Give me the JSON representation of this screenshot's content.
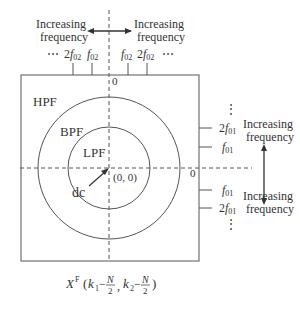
{
  "diagram": {
    "regions": {
      "hpf": "HPF",
      "bpf": "BPF",
      "lpf": "LPF",
      "dc": "dc",
      "origin": "(0, 0)"
    },
    "top_axis": {
      "zero_label": "0",
      "left_caption": [
        "Increasing",
        "frequency"
      ],
      "right_caption": [
        "Increasing",
        "frequency"
      ],
      "left_ellipsis": "⋯",
      "right_ellipsis": "⋯",
      "ticks": [
        {
          "coef": "2",
          "base": "f",
          "sub": "02"
        },
        {
          "coef": "",
          "base": "f",
          "sub": "02"
        },
        {
          "coef": "",
          "base": "f",
          "sub": "02"
        },
        {
          "coef": "2",
          "base": "f",
          "sub": "02"
        }
      ]
    },
    "right_axis": {
      "zero_label": "0",
      "top_caption": [
        "Increasing",
        "frequency"
      ],
      "bottom_caption": [
        "Increasing",
        "frequency"
      ],
      "ellipsis": "⋮",
      "ticks": [
        {
          "coef": "2",
          "base": "f",
          "sub": "01"
        },
        {
          "coef": "",
          "base": "f",
          "sub": "01"
        },
        {
          "coef": "",
          "base": "f",
          "sub": "01"
        },
        {
          "coef": "2",
          "base": "f",
          "sub": "01"
        }
      ]
    },
    "formula": {
      "base": "X",
      "sup": "F",
      "open": "(",
      "k1": "k",
      "k1_sub": "1",
      "minus": "−",
      "N": "N",
      "two": "2",
      "comma": ",",
      "k2": "k",
      "k2_sub": "2",
      "close": ")"
    },
    "colors": {
      "line": "#555555",
      "text": "#333333"
    }
  }
}
